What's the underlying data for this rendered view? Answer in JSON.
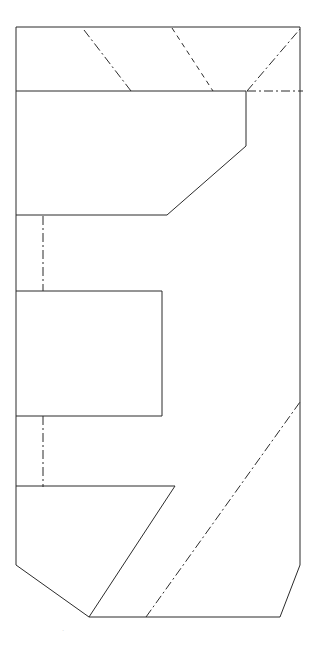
{
  "sheet": {
    "title": "Orthographic Section View",
    "width": 317,
    "height": 646,
    "background_color": "#ffffff",
    "line_color": "#2b2b2b",
    "faint_color": "#d8d8d8",
    "line_width": 1,
    "faint_mark_text": "."
  },
  "geometry": {
    "outer_profile": {
      "name": "part-outline",
      "style": "solid",
      "closed": true,
      "points": [
        [
          16,
          27
        ],
        [
          300,
          27
        ],
        [
          300,
          565
        ],
        [
          280,
          617
        ],
        [
          89,
          617
        ],
        [
          16,
          565
        ]
      ]
    },
    "inner_profiles": [
      {
        "name": "upper-arm-outline",
        "style": "solid",
        "closed": false,
        "points": [
          [
            16,
            91
          ],
          [
            246,
            91
          ],
          [
            246,
            146
          ],
          [
            167,
            215
          ],
          [
            16,
            215
          ]
        ]
      },
      {
        "name": "middle-arm-outline",
        "style": "solid",
        "closed": false,
        "points": [
          [
            16,
            291
          ],
          [
            162,
            291
          ],
          [
            162,
            416
          ],
          [
            16,
            416
          ]
        ]
      },
      {
        "name": "lower-arm-outline",
        "style": "solid",
        "closed": false,
        "points": [
          [
            16,
            486
          ],
          [
            175,
            486
          ],
          [
            89,
            617
          ]
        ]
      }
    ],
    "center_lines": [
      {
        "name": "center-line-diagonal-upper-left",
        "style": "dash-dot",
        "points": [
          [
            84,
            30
          ],
          [
            131,
            91
          ]
        ]
      },
      {
        "name": "center-line-diagonal-upper-right",
        "style": "dash-dot",
        "points": [
          [
            247,
            91
          ],
          [
            300,
            29
          ]
        ]
      },
      {
        "name": "center-line-horizontal-upper-right",
        "style": "dash-dot",
        "points": [
          [
            247,
            91
          ],
          [
            303,
            91
          ]
        ]
      },
      {
        "name": "center-line-diagonal-lower-right",
        "style": "dash-dot",
        "points": [
          [
            146,
            617
          ],
          [
            300,
            402
          ]
        ]
      },
      {
        "name": "center-line-vertical-upper",
        "style": "dash-dot",
        "points": [
          [
            43,
            216
          ],
          [
            43,
            291
          ]
        ]
      },
      {
        "name": "center-line-vertical-lower",
        "style": "dash-dot",
        "points": [
          [
            43,
            416
          ],
          [
            43,
            487
          ]
        ]
      }
    ],
    "hidden_lines": [
      {
        "name": "hidden-line-diagonal-upper-middle",
        "style": "dashed",
        "points": [
          [
            172,
            28
          ],
          [
            213,
            91
          ]
        ]
      }
    ]
  },
  "line_styles": {
    "solid": {
      "label": "Visible edge",
      "dasharray": "none"
    },
    "dashed": {
      "label": "Hidden edge",
      "dasharray": "5 4"
    },
    "dash-dot": {
      "label": "Center line",
      "dasharray": "9 3 2 3"
    }
  }
}
